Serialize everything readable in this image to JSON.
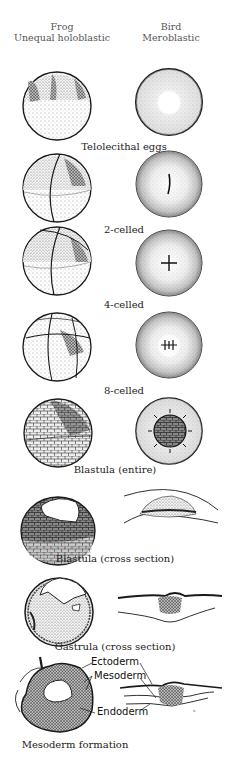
{
  "figure": {
    "columns": {
      "left": {
        "title": "Frog",
        "subtitle": "Unequal holoblastic"
      },
      "right": {
        "title": "Bird",
        "subtitle": "Meroblastic"
      }
    },
    "stages": [
      {
        "caption": "Telolecithal eggs"
      },
      {
        "caption": "2-celled"
      },
      {
        "caption": "4-celled"
      },
      {
        "caption": "8-celled"
      },
      {
        "caption": "Blastula (entire)"
      },
      {
        "caption": "Blastula (cross section)"
      },
      {
        "caption": "Gastrula (cross section)"
      },
      {
        "caption": "Mesoderm formation"
      }
    ],
    "labels": {
      "ectoderm": "Ectoderm",
      "mesoderm": "Mesoderm",
      "endoderm": "Endoderm"
    },
    "colors": {
      "ink": "#1a1a1a",
      "stipple_light": "#d8d8d8",
      "stipple_mid": "#9a9a9a",
      "stipple_dark": "#4a4a4a",
      "background": "#ffffff"
    }
  }
}
